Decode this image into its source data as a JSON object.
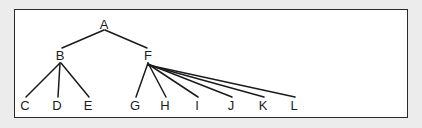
{
  "figure": {
    "type": "tree-diagram",
    "background_color": "#ececed",
    "panel_color": "#ffffff",
    "border_color": "#2b2b2e",
    "stroke_color": "#1b1b1d",
    "frame": {
      "x": 14,
      "y": 9,
      "width": 394,
      "height": 109
    }
  },
  "nodes": [
    {
      "id": "A",
      "label": "A",
      "x": 104,
      "y": 24,
      "level": 0
    },
    {
      "id": "B",
      "label": "B",
      "x": 60,
      "y": 55,
      "level": 1
    },
    {
      "id": "F",
      "label": "F",
      "x": 148,
      "y": 55,
      "level": 1
    },
    {
      "id": "C",
      "label": "C",
      "x": 25,
      "y": 105,
      "level": 2
    },
    {
      "id": "D",
      "label": "D",
      "x": 57,
      "y": 105,
      "level": 2
    },
    {
      "id": "E",
      "label": "E",
      "x": 88,
      "y": 105,
      "level": 2
    },
    {
      "id": "G",
      "label": "G",
      "x": 135,
      "y": 105,
      "level": 2
    },
    {
      "id": "H",
      "label": "H",
      "x": 165,
      "y": 105,
      "level": 2
    },
    {
      "id": "I",
      "label": "I",
      "x": 197,
      "y": 105,
      "level": 2
    },
    {
      "id": "J",
      "label": "J",
      "x": 231,
      "y": 105,
      "level": 2
    },
    {
      "id": "K",
      "label": "K",
      "x": 263,
      "y": 105,
      "level": 2
    },
    {
      "id": "L",
      "label": "L",
      "x": 294,
      "y": 105,
      "level": 2
    }
  ],
  "edges": [
    {
      "from": "A",
      "to": "B",
      "x1": 104,
      "y1": 30,
      "x2": 62,
      "y2": 48
    },
    {
      "from": "A",
      "to": "F",
      "x1": 105,
      "y1": 30,
      "x2": 147,
      "y2": 48
    },
    {
      "from": "B",
      "to": "C",
      "x1": 60,
      "y1": 63,
      "x2": 26,
      "y2": 97
    },
    {
      "from": "B",
      "to": "D",
      "x1": 60,
      "y1": 63,
      "x2": 58,
      "y2": 97
    },
    {
      "from": "B",
      "to": "E",
      "x1": 61,
      "y1": 63,
      "x2": 89,
      "y2": 97
    },
    {
      "from": "F",
      "to": "G",
      "x1": 148,
      "y1": 63,
      "x2": 136,
      "y2": 97
    },
    {
      "from": "F",
      "to": "H",
      "x1": 148,
      "y1": 63,
      "x2": 166,
      "y2": 97
    },
    {
      "from": "F",
      "to": "I",
      "x1": 148,
      "y1": 64,
      "x2": 198,
      "y2": 97
    },
    {
      "from": "F",
      "to": "J",
      "x1": 148,
      "y1": 64,
      "x2": 232,
      "y2": 97
    },
    {
      "from": "F",
      "to": "K",
      "x1": 148,
      "y1": 65,
      "x2": 264,
      "y2": 97
    },
    {
      "from": "F",
      "to": "L",
      "x1": 148,
      "y1": 65,
      "x2": 295,
      "y2": 97
    }
  ]
}
